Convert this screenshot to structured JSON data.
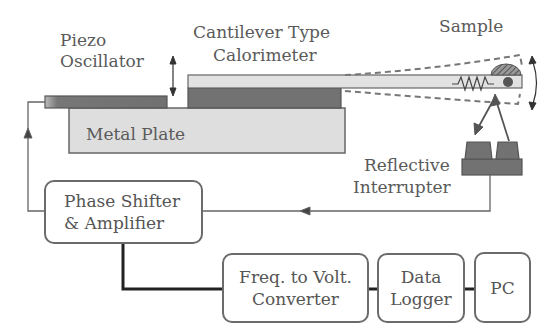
{
  "labels": {
    "piezo_line1": "Piezo",
    "piezo_line2": "Oscillator",
    "cantilever_line1": "Cantilever Type",
    "cantilever_line2": "Calorimeter",
    "sample": "Sample",
    "metal_plate": "Metal Plate",
    "reflective_line1": "Reflective",
    "reflective_line2": "Interrupter"
  },
  "blocks": {
    "phase_shifter": {
      "line1": "Phase Shifter",
      "line2": "& Amplifier"
    },
    "f2v": {
      "line1": "Freq. to Volt.",
      "line2": "Converter"
    },
    "data_logger": {
      "line1": "Data",
      "line2": "Logger"
    },
    "pc": {
      "line1": "PC"
    }
  },
  "colors": {
    "dark_gray": "#6e6e6e",
    "light_gray": "#dcdcdc",
    "line": "#666666"
  }
}
